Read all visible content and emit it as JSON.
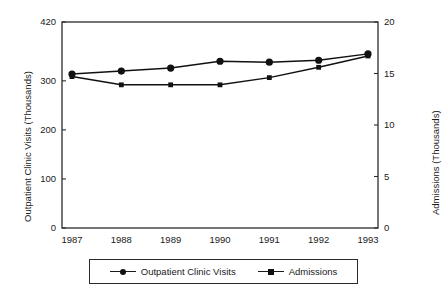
{
  "chart_data": {
    "type": "line",
    "title": "",
    "xlabel": "",
    "categories": [
      "1987",
      "1988",
      "1989",
      "1990",
      "1991",
      "1992",
      "1993"
    ],
    "grid": false,
    "legend_position": "bottom",
    "axes": {
      "left": {
        "label": "Outpatient Clinic Visits (Thousands)",
        "ticks": [
          "0",
          "100",
          "200",
          "300",
          "420"
        ],
        "tick_values": [
          0,
          100,
          200,
          300,
          420
        ],
        "min": 0,
        "max": 420
      },
      "right": {
        "label": "Admissions (Thousands)",
        "ticks": [
          "0",
          "5",
          "10",
          "15",
          "20"
        ],
        "tick_values": [
          0,
          5,
          10,
          15,
          20
        ],
        "min": 0,
        "max": 20
      }
    },
    "series": [
      {
        "name": "Outpatient Clinic Visits",
        "axis": "left",
        "marker": "circle",
        "color": "#111111",
        "values": [
          314,
          320,
          326,
          340,
          338,
          342,
          355
        ]
      },
      {
        "name": "Admissions",
        "axis": "right",
        "marker": "square",
        "color": "#111111",
        "values": [
          14.7,
          13.9,
          13.9,
          13.9,
          14.6,
          15.6,
          16.7
        ]
      }
    ]
  },
  "legend": {
    "entries": [
      {
        "label": "Outpatient Clinic Visits",
        "marker": "circle-marker-icon"
      },
      {
        "label": "Admissions",
        "marker": "square-marker-icon"
      }
    ]
  }
}
